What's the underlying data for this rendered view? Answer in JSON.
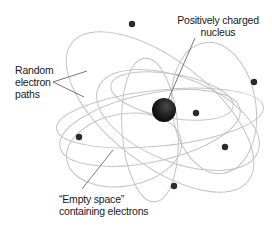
{
  "diagram": {
    "labels": {
      "nucleus": {
        "line1": "Positively charged",
        "line2": "nucleus"
      },
      "paths": {
        "line1": "Random",
        "line2": "electron",
        "line3": "paths"
      },
      "empty_space": {
        "line1": "“Empty space”",
        "line2": "containing electrons"
      }
    },
    "colors": {
      "orbit": "#c4c4c4",
      "electron": "#2a2a2a",
      "nucleus": "#151515",
      "leader": "#555555",
      "text": "#1a1a1a"
    },
    "nucleus": {
      "cx": 164,
      "cy": 110,
      "r": 12
    },
    "electrons": [
      {
        "cx": 132,
        "cy": 24
      },
      {
        "cx": 254,
        "cy": 82
      },
      {
        "cx": 196,
        "cy": 113
      },
      {
        "cx": 79,
        "cy": 137
      },
      {
        "cx": 225,
        "cy": 147
      },
      {
        "cx": 174,
        "cy": 186
      }
    ]
  }
}
